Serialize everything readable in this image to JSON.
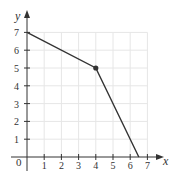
{
  "chart_data": {
    "type": "line",
    "title": "",
    "xlabel": "x",
    "ylabel": "y",
    "origin_label": "0",
    "xlim": [
      0,
      7
    ],
    "ylim": [
      0,
      7
    ],
    "x_ticks": [
      1,
      2,
      3,
      4,
      5,
      6,
      7
    ],
    "y_ticks": [
      1,
      2,
      3,
      4,
      5,
      6,
      7
    ],
    "grid": true,
    "series": [
      {
        "name": "piecewise line",
        "points": [
          [
            0,
            7
          ],
          [
            4,
            5
          ],
          [
            6.5,
            0
          ]
        ],
        "marked_points": [
          [
            4,
            5
          ]
        ]
      }
    ]
  },
  "colors": {
    "line": "#333333",
    "grid": "#e6e6e6",
    "axis": "#333333",
    "text": "#333333"
  }
}
